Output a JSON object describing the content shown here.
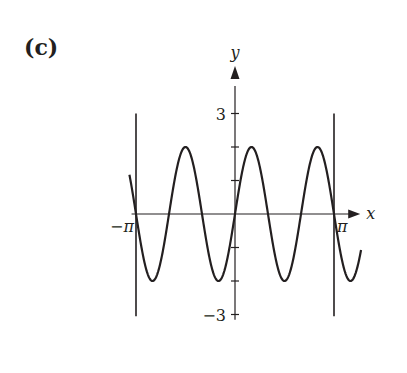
{
  "panel_label": "(c)",
  "chart_data": {
    "type": "line",
    "title": "",
    "function": "y = 2 sin(3x)",
    "xlabel": "x",
    "ylabel": "y",
    "x_ticks": [
      {
        "value": -3.14159,
        "label": "−π"
      },
      {
        "value": 3.14159,
        "label": "π"
      }
    ],
    "y_ticks": [
      {
        "value": 3,
        "label": "3"
      },
      {
        "value": 2,
        "label": ""
      },
      {
        "value": 1,
        "label": ""
      },
      {
        "value": -1,
        "label": ""
      },
      {
        "value": -2,
        "label": ""
      },
      {
        "value": -3,
        "label": "−3"
      }
    ],
    "xlim": [
      -3.6,
      4.1
    ],
    "ylim": [
      -3.1,
      4.0
    ],
    "amplitude": 2,
    "period": 2.0944,
    "x_range": [
      -3.35,
      4.0
    ],
    "vertical_lines": [
      {
        "x": -3.14159,
        "y_range": [
          -3.05,
          3.0
        ]
      },
      {
        "x": 3.14159,
        "y_range": [
          -3.05,
          3.0
        ]
      }
    ],
    "grid": false,
    "legend": null
  },
  "colors": {
    "ink": "#231f20",
    "background": "#ffffff"
  }
}
